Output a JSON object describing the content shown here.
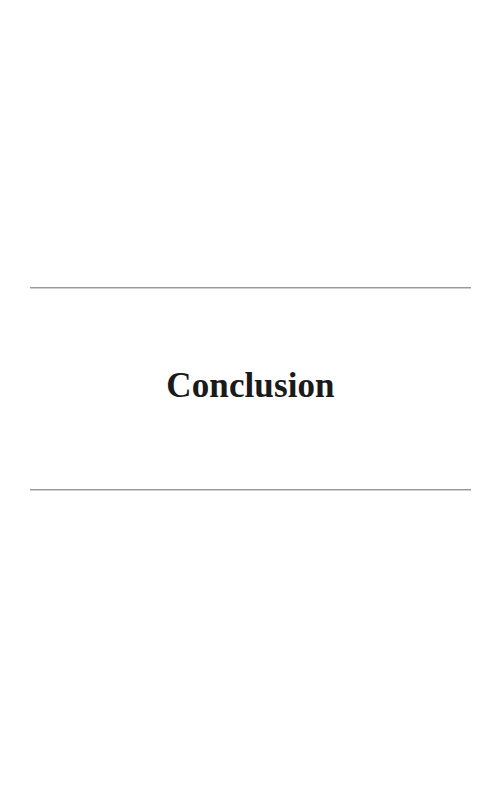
{
  "document": {
    "page_background": "#ffffff",
    "page_width": 500,
    "page_height": 792
  },
  "part_title_block": {
    "title": "Conclusion",
    "title_color": "#1a1a1a",
    "rule_color": "#9a9a9a",
    "rule_top_label": "",
    "rule_bottom_label": ""
  },
  "blank_areas": {
    "above_title": "",
    "below_title": ""
  }
}
